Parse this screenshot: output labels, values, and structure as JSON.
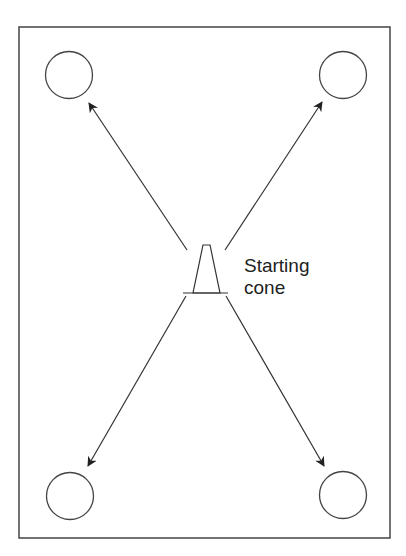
{
  "diagram": {
    "label_line1": "Starting",
    "label_line2": "cone",
    "stroke_color": "#333333",
    "elements": {
      "field": "rectangle boundary",
      "markers": [
        "top-left circle",
        "top-right circle",
        "bottom-left circle",
        "bottom-right circle"
      ],
      "center": "starting cone",
      "arrows": [
        "to top-left",
        "to top-right",
        "to bottom-left",
        "to bottom-right"
      ]
    }
  }
}
